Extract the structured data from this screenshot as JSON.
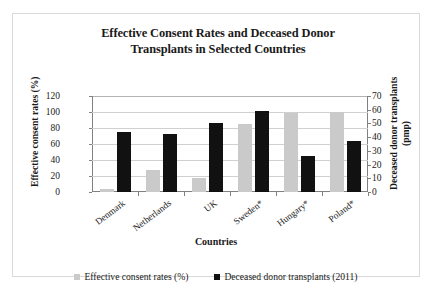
{
  "chart_data": {
    "type": "bar",
    "title": "Effective Consent Rates and Deceased Donor Transplants in Selected Countries",
    "title_line1": "Effective Consent Rates and Deceased Donor",
    "title_line2": "Transplants in Selected Countries",
    "xlabel": "Countries",
    "ylabel": "Effective consent rates (%)",
    "ylabel_right": "Deceased donor transplants (pmp)",
    "categories": [
      "Denmark",
      "Netherlands",
      "UK",
      "Sweden*",
      "Hungary*",
      "Poland*"
    ],
    "series": [
      {
        "name": "Effective consent rates (%)",
        "axis": "left",
        "color": "#cacaca",
        "values": [
          4,
          27,
          17,
          85,
          99,
          100
        ]
      },
      {
        "name": "Deceased donor transplants (2011)",
        "axis": "right",
        "color": "#111111",
        "values": [
          44,
          42,
          50,
          59,
          26,
          37
        ]
      }
    ],
    "ylim": [
      0,
      120
    ],
    "yticks": [
      0,
      20,
      40,
      60,
      80,
      100,
      120
    ],
    "ylim_right": [
      0,
      70
    ],
    "yticks_right": [
      0,
      10,
      20,
      30,
      40,
      50,
      60,
      70
    ],
    "grid": true,
    "legend_position": "bottom",
    "legend": [
      "Effective consent rates (%)",
      "Deceased donor transplants (2011)"
    ]
  }
}
